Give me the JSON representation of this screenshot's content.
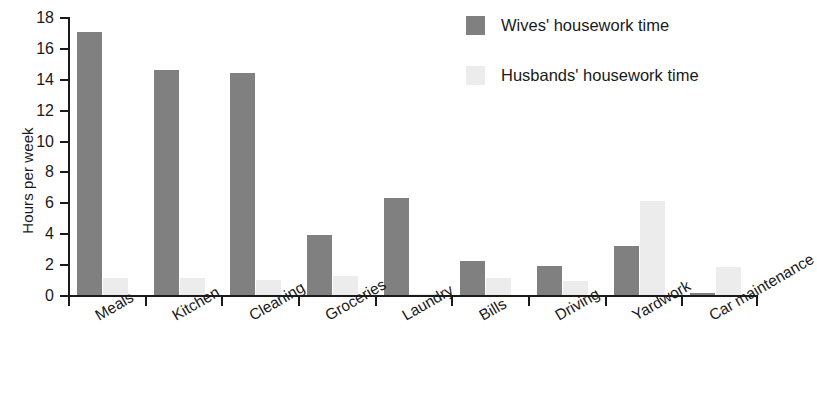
{
  "chart_data": {
    "type": "bar",
    "title": "",
    "xlabel": "",
    "ylabel": "Hours per week",
    "ylim": [
      0,
      18
    ],
    "ytick_step": 2,
    "yticks": [
      0,
      2,
      4,
      6,
      8,
      10,
      12,
      14,
      16,
      18
    ],
    "grid": false,
    "legend_position": "top-right",
    "categories": [
      "Meals",
      "Kitchen",
      "Cleaning",
      "Groceries",
      "Laundry",
      "Bills",
      "Driving",
      "Yardwork",
      "Car maintenance"
    ],
    "series": [
      {
        "name": "Wives' housework time",
        "color": "#808080",
        "values": [
          17.0,
          14.6,
          14.4,
          3.9,
          6.3,
          2.2,
          1.9,
          3.2,
          0.1
        ]
      },
      {
        "name": "Husbands' housework time",
        "color": "#ececec",
        "values": [
          1.1,
          1.1,
          1.0,
          1.2,
          0.05,
          1.1,
          0.9,
          6.1,
          1.8
        ]
      }
    ]
  },
  "legend": {
    "items": [
      {
        "label": "Wives' housework time",
        "swatch": "wives-swatch"
      },
      {
        "label": "Husbands' housework time",
        "swatch": "husbands-swatch"
      }
    ]
  },
  "axes": {
    "y_axis_title": "Hours per week"
  },
  "colors": {
    "wives": "#808080",
    "husbands": "#ececec",
    "axis": "#1a1a1a",
    "background": "#ffffff"
  }
}
